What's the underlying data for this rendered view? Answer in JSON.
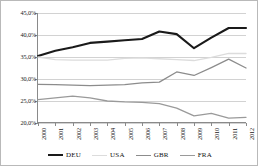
{
  "chart_data": {
    "type": "line",
    "title": "",
    "xlabel": "",
    "ylabel": "",
    "x": [
      "2000",
      "2001",
      "2002",
      "2003",
      "2004",
      "2005",
      "2006",
      "2007",
      "2008",
      "2009",
      "2010",
      "2011",
      "2012"
    ],
    "ylim": [
      20.0,
      45.0
    ],
    "ytick_labels": [
      "45,0%",
      "40,0%",
      "35,0%",
      "30,0%",
      "25,0%",
      "20,0%"
    ],
    "ytick_values": [
      45.0,
      40.0,
      35.0,
      30.0,
      25.0,
      20.0
    ],
    "grid": true,
    "legend_position": "bottom",
    "value_suffix": "%",
    "decimal_separator": ",",
    "series": [
      {
        "name": "DEU",
        "color": "#1a1a1a",
        "width": 2.1,
        "values": [
          35.2,
          36.4,
          37.2,
          38.2,
          38.5,
          38.8,
          39.1,
          40.8,
          40.2,
          37.0,
          39.4,
          41.6,
          41.6
        ]
      },
      {
        "name": "USA",
        "color": "#dcdcdc",
        "width": 1.3,
        "values": [
          35.0,
          34.4,
          34.3,
          34.3,
          34.3,
          34.7,
          34.8,
          34.6,
          34.4,
          34.2,
          34.9,
          35.8,
          35.8
        ]
      },
      {
        "name": "GBR",
        "color": "#8c8c8c",
        "width": 1.3,
        "values": [
          28.8,
          28.7,
          28.6,
          28.5,
          28.6,
          28.7,
          29.1,
          29.3,
          31.6,
          30.8,
          32.6,
          34.5,
          32.5
        ]
      },
      {
        "name": "FRA",
        "color": "#9a9a9a",
        "width": 1.3,
        "values": [
          25.3,
          25.7,
          26.1,
          25.7,
          25.0,
          24.8,
          24.7,
          24.4,
          23.4,
          21.6,
          22.2,
          21.1,
          21.3
        ]
      }
    ]
  },
  "legend": {
    "items": [
      {
        "label": "DEU"
      },
      {
        "label": "USA"
      },
      {
        "label": "GBR"
      },
      {
        "label": "FRA"
      }
    ]
  }
}
